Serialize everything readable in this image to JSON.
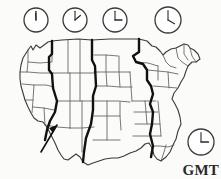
{
  "figure": {
    "background_color": "#fbfbfa",
    "line_color": "#3a3a3a",
    "boundary_color": "#111111",
    "label_color": "#2a2a2a"
  },
  "legend": {
    "gmt_label": "GMT"
  },
  "clocks": [
    {
      "name": "pacific-clock",
      "cx": 36,
      "cy": 20,
      "r": 12,
      "hour_angle": 357,
      "minute_angle": 0,
      "time_reading": "12:00"
    },
    {
      "name": "mountain-clock",
      "cx": 75,
      "cy": 20,
      "r": 12,
      "hour_angle": 50,
      "minute_angle": 0,
      "time_reading": "1:00"
    },
    {
      "name": "central-clock",
      "cx": 115,
      "cy": 20,
      "r": 12,
      "hour_angle": 90,
      "minute_angle": 0,
      "time_reading": "3:00"
    },
    {
      "name": "eastern-clock",
      "cx": 168,
      "cy": 20,
      "r": 13,
      "hour_angle": 120,
      "minute_angle": 0,
      "time_reading": "4:00"
    },
    {
      "name": "gmt-clock",
      "cx": 201,
      "cy": 142,
      "r": 13,
      "hour_angle": 90,
      "minute_angle": 0,
      "time_reading": "3:00"
    }
  ],
  "zone_boundaries": [
    {
      "name": "pacific-mountain-boundary",
      "path": "M 52 41 L 52 54 L 49 57 L 49 70 L 52 74 L 53 88 L 57 101 L 55 112 L 50 121 L 47 130 L 45 140"
    },
    {
      "name": "mountain-central-boundary",
      "path": "M 92 40 L 92 60 L 95 66 L 96 86 L 93 96 L 93 110 L 91 124 L 86 138 L 84 152 L 83 162"
    },
    {
      "name": "central-eastern-boundary",
      "path": "M 139 39 L 139 52 L 133 56 L 136 62 L 143 64 L 147 70 L 147 80 L 151 86 L 153 94 L 150 104 L 153 112 L 152 124 L 150 134 L 153 146 L 151 157"
    }
  ],
  "annotations": [
    {
      "name": "zone-shift-arrow",
      "path": "M 41 152 L 57 125",
      "head": "M 57 125 L 49 128 L 53 133 Z"
    }
  ],
  "map_outline": {
    "name": "us-national-border",
    "path": "M 28 50 L 31 46 L 33 50 L 36 45 L 40 48 L 44 45 L 48 42 L 52 41 L 62 40 L 78 39 L 92 40 L 110 39 L 124 39 L 139 39 L 147 41 L 152 46 L 156 47 L 160 51 L 163 55 L 166 52 L 171 49 L 176 48 L 180 46 L 184 44 L 188 45 L 190 48 L 194 50 L 198 54 L 200 59 L 196 62 L 192 62 L 188 66 L 186 71 L 184 77 L 181 82 L 178 88 L 174 93 L 172 99 L 175 104 L 178 110 L 180 117 L 181 124 L 178 131 L 176 139 L 173 145 L 170 152 L 166 157 L 161 161 L 157 159 L 154 155 L 152 148 L 149 143 L 145 144 L 141 148 L 136 151 L 130 153 L 124 156 L 118 158 L 112 158 L 105 159 L 99 161 L 93 163 L 88 165 L 83 162 L 80 157 L 76 154 L 72 157 L 68 160 L 64 159 L 61 155 L 58 150 L 55 143 L 52 137 L 49 131 L 46 126 L 43 122 L 38 121 L 34 118 L 31 113 L 28 107 L 25 100 L 23 93 L 21 86 L 20 79 L 20 72 L 21 65 L 23 58 Z"
  },
  "state_lines": [
    {
      "name": "state-line-1",
      "path": "M 28 50 L 28 62 L 40 63 L 52 62 L 52 41"
    },
    {
      "name": "state-line-2",
      "path": "M 20 72 L 28 72 L 40 73 L 53 73"
    },
    {
      "name": "state-line-3",
      "path": "M 28 62 L 27 72"
    },
    {
      "name": "state-line-4",
      "path": "M 22 84 L 34 85 L 46 85 L 54 87"
    },
    {
      "name": "state-line-5",
      "path": "M 34 85 L 33 100 L 32 113"
    },
    {
      "name": "state-line-6",
      "path": "M 25 100 L 33 100"
    },
    {
      "name": "state-line-7",
      "path": "M 33 107 L 44 108 L 54 110"
    },
    {
      "name": "state-line-8",
      "path": "M 44 108 L 45 125"
    },
    {
      "name": "state-line-9",
      "path": "M 45 125 L 57 127 L 70 128"
    },
    {
      "name": "state-line-10",
      "path": "M 57 101 L 70 101 L 82 101 L 93 101"
    },
    {
      "name": "state-line-11",
      "path": "M 53 73 L 68 73 L 80 73 L 94 73"
    },
    {
      "name": "state-line-12",
      "path": "M 68 40 L 68 73"
    },
    {
      "name": "state-line-13",
      "path": "M 80 39 L 80 73 L 80 101"
    },
    {
      "name": "state-line-14",
      "path": "M 70 73 L 70 101 L 70 128"
    },
    {
      "name": "state-line-15",
      "path": "M 82 101 L 82 128 L 82 152"
    },
    {
      "name": "state-line-16",
      "path": "M 70 128 L 82 128 L 94 127"
    },
    {
      "name": "state-line-17",
      "path": "M 94 55 L 106 55 L 118 56"
    },
    {
      "name": "state-line-18",
      "path": "M 94 72 L 106 72 L 119 72 L 130 72"
    },
    {
      "name": "state-line-19",
      "path": "M 96 86 L 108 86 L 120 87 L 132 87"
    },
    {
      "name": "state-line-20",
      "path": "M 106 55 L 106 72 L 107 86"
    },
    {
      "name": "state-line-21",
      "path": "M 119 56 L 119 72 L 120 87"
    },
    {
      "name": "state-line-22",
      "path": "M 93 101 L 106 101 L 118 101 L 130 102"
    },
    {
      "name": "state-line-23",
      "path": "M 107 101 L 107 120 L 107 140"
    },
    {
      "name": "state-line-24",
      "path": "M 94 116 L 107 116 L 120 116"
    },
    {
      "name": "state-line-25",
      "path": "M 120 102 L 120 116 L 121 130"
    },
    {
      "name": "state-line-26",
      "path": "M 93 140 L 107 140 L 120 140"
    },
    {
      "name": "state-line-27",
      "path": "M 130 72 L 131 87 L 132 101"
    },
    {
      "name": "state-line-28",
      "path": "M 132 101 L 144 101 L 156 101"
    },
    {
      "name": "state-line-29",
      "path": "M 134 112 L 146 112 L 158 112"
    },
    {
      "name": "state-line-30",
      "path": "M 135 124 L 148 124 L 160 124"
    },
    {
      "name": "state-line-31",
      "path": "M 145 101 L 146 112 L 147 124"
    },
    {
      "name": "state-line-32",
      "path": "M 158 101 L 159 112 L 160 124 L 161 136"
    },
    {
      "name": "state-line-33",
      "path": "M 133 136 L 146 136 L 161 136"
    },
    {
      "name": "state-line-34",
      "path": "M 136 62 L 148 63 L 158 66"
    },
    {
      "name": "state-line-35",
      "path": "M 147 70 L 158 71 L 168 72 L 178 74"
    },
    {
      "name": "state-line-36",
      "path": "M 158 66 L 158 80"
    },
    {
      "name": "state-line-37",
      "path": "M 153 86 L 166 87 L 177 88"
    },
    {
      "name": "state-line-38",
      "path": "M 168 72 L 169 88"
    },
    {
      "name": "state-line-39",
      "path": "M 163 55 L 166 62 L 170 66 L 176 68"
    },
    {
      "name": "state-line-40",
      "path": "M 176 48 L 178 58 L 182 62 L 188 66"
    },
    {
      "name": "state-line-41",
      "path": "M 184 44 L 184 54 L 188 60"
    },
    {
      "name": "state-line-42",
      "path": "M 190 48 L 192 56 L 196 62"
    },
    {
      "name": "state-line-43",
      "path": "M 153 146 L 160 146 L 168 147 L 174 145"
    },
    {
      "name": "state-line-44",
      "path": "M 161 161 L 164 152 L 166 145"
    }
  ]
}
